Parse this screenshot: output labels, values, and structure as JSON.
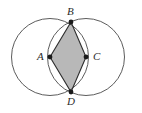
{
  "figure": {
    "background_color": "#ffffff",
    "stroke_color": "#4a4a4a",
    "rhombus_stroke_color": "#2e2e2e",
    "rhombus_fill_color": "#b8b8b8",
    "vertex_dot_color": "#1a1a1a",
    "labels": {
      "a": "A",
      "b": "B",
      "c": "C",
      "d": "D"
    }
  },
  "chart_data": {
    "type": "scatter",
    "xlabel": "",
    "ylabel": "",
    "xlim": [
      0,
      142
    ],
    "ylim": [
      113,
      0
    ],
    "grid": false,
    "legend": "none",
    "circles": [
      {
        "name": "left-circle",
        "cx": 50,
        "cy": 57,
        "r": 38.5
      },
      {
        "name": "right-circle",
        "cx": 86,
        "cy": 57,
        "r": 38.5
      }
    ],
    "points": [
      {
        "label": "A",
        "x": 50,
        "y": 57,
        "role": "left-circle-center",
        "marker": "filled-dot"
      },
      {
        "label": "B",
        "x": 71,
        "y": 22,
        "role": "upper-intersection",
        "marker": "filled-dot"
      },
      {
        "label": "C",
        "x": 86,
        "y": 57,
        "role": "right-circle-center",
        "marker": "filled-dot"
      },
      {
        "label": "D",
        "x": 71,
        "y": 92,
        "role": "lower-intersection",
        "marker": "filled-dot"
      }
    ],
    "polygon": {
      "name": "rhombus-ABCD",
      "vertices": [
        [
          50,
          57
        ],
        [
          71,
          22
        ],
        [
          86,
          57
        ],
        [
          71,
          92
        ]
      ],
      "fill": "#b8b8b8",
      "stroke": "#2e2e2e",
      "shaded": true
    },
    "annotations": [
      {
        "text": "A",
        "x": 41,
        "y": 57
      },
      {
        "text": "B",
        "x": 71,
        "y": 11
      },
      {
        "text": "C",
        "x": 96,
        "y": 57
      },
      {
        "text": "D",
        "x": 71,
        "y": 101
      }
    ]
  }
}
